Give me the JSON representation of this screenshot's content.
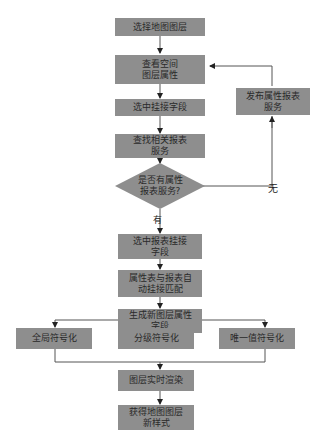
{
  "diagram": {
    "type": "flowchart",
    "colors": {
      "box_fill": "#8e8e8e",
      "line": "#555555",
      "text": "#2a2a2a",
      "background": "#ffffff"
    },
    "nodes": {
      "n1": {
        "label": "选择地图图层"
      },
      "n2": {
        "line1": "查看空间",
        "line2": "图层属性"
      },
      "n3": {
        "label": "选中挂接字段"
      },
      "n4": {
        "line1": "查找相关报表",
        "line2": "服务"
      },
      "decision": {
        "line1": "是否有属性",
        "line2": "报表服务?"
      },
      "publish": {
        "line1": "发布属性报表",
        "line2": "服务"
      },
      "n5": {
        "line1": "选中报表挂接",
        "line2": "字段"
      },
      "n6": {
        "line1": "属性表与报表自",
        "line2": "动挂接匹配"
      },
      "n7": {
        "line1": "生成新图层属性",
        "line2": "字段"
      },
      "sym1": {
        "label": "全局符号化"
      },
      "sym2": {
        "label": "分级符号化"
      },
      "sym3": {
        "label": "唯一值符号化"
      },
      "n8": {
        "label": "图层实时渲染"
      },
      "n9": {
        "line1": "获得地图图层",
        "line2": "新样式"
      }
    },
    "edge_labels": {
      "yes": "有",
      "no": "无"
    }
  }
}
